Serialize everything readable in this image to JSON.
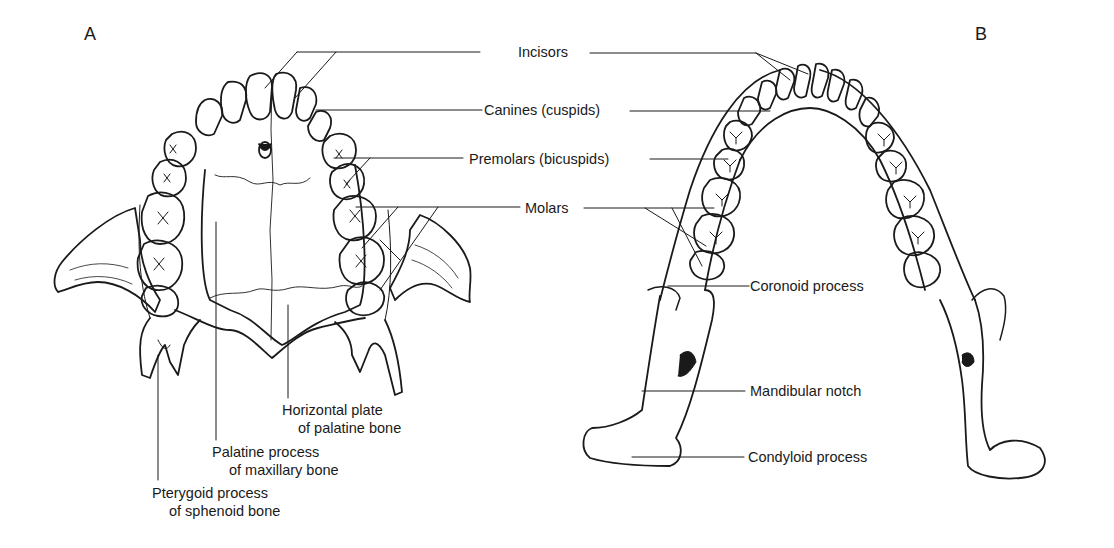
{
  "figure": {
    "panels": [
      {
        "letter": "A",
        "view": "maxilla (upper dental arch, inferior view)"
      },
      {
        "letter": "B",
        "view": "mandible (lower dental arch, superior view)"
      }
    ],
    "center_labels": {
      "incisors": "Incisors",
      "canines": "Canines (cuspids)",
      "premolars": "Premolars (bicuspids)",
      "molars": "Molars"
    },
    "panel_a_labels": {
      "horizontal_plate": [
        "Horizontal plate",
        "of palatine bone"
      ],
      "palatine_process": [
        "Palatine process",
        "of maxillary bone"
      ],
      "pterygoid_process": [
        "Pterygoid process",
        "of sphenoid bone"
      ]
    },
    "panel_b_labels": {
      "coronoid": "Coronoid process",
      "mandibular_notch": "Mandibular notch",
      "condyloid": "Condyloid process"
    },
    "colors": {
      "line": "#1a1a1a",
      "background": "#ffffff"
    }
  }
}
